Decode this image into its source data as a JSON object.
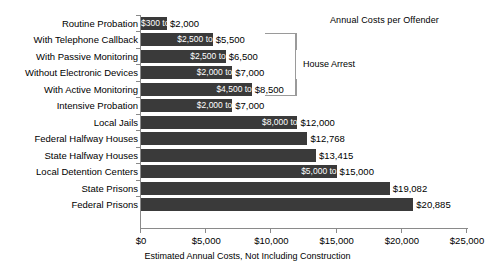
{
  "chart_data": {
    "type": "bar",
    "orientation": "horizontal",
    "title": "Annual Costs per Offender",
    "xlabel": "Estimated Annual Costs, Not Including Construction",
    "ylabel": "",
    "xlim": [
      0,
      25000
    ],
    "xticks": [
      0,
      5000,
      10000,
      15000,
      20000,
      25000
    ],
    "xtick_labels": [
      "$0",
      "$5,000",
      "$10,000",
      "$15,000",
      "$20,000",
      "$25,000"
    ],
    "grid": false,
    "legend": null,
    "categories": [
      "Routine Probation",
      "With Telephone Callback",
      "With Passive Monitoring",
      "Without Electronic Devices",
      "With Active Monitoring",
      "Intensive Probation",
      "Local Jails",
      "Federal Halfway Houses",
      "State Halfway Houses",
      "Local Detention Centers",
      "State Prisons",
      "Federal Prisons"
    ],
    "values": [
      2000,
      5500,
      6500,
      7000,
      8500,
      7000,
      12000,
      12768,
      13415,
      15000,
      19082,
      20885
    ],
    "range_low": [
      300,
      2500,
      2500,
      2000,
      4500,
      2000,
      8000,
      null,
      null,
      5000,
      null,
      null
    ],
    "bars": [
      {
        "category": "Routine Probation",
        "low": 300,
        "high": 2000,
        "inbar_label": "$300 to",
        "outbar_label": "$2,000"
      },
      {
        "category": "With Telephone Callback",
        "low": 2500,
        "high": 5500,
        "inbar_label": "$2,500 to",
        "outbar_label": "$5,500"
      },
      {
        "category": "With Passive Monitoring",
        "low": 2500,
        "high": 6500,
        "inbar_label": "$2,500 to",
        "outbar_label": "$6,500"
      },
      {
        "category": "Without Electronic Devices",
        "low": 2000,
        "high": 7000,
        "inbar_label": "$2,000 to",
        "outbar_label": "$7,000"
      },
      {
        "category": "With Active Monitoring",
        "low": 4500,
        "high": 8500,
        "inbar_label": "$4,500 to",
        "outbar_label": "$8,500"
      },
      {
        "category": "Intensive Probation",
        "low": 2000,
        "high": 7000,
        "inbar_label": "$2,000 to",
        "outbar_label": "$7,000"
      },
      {
        "category": "Local Jails",
        "low": 8000,
        "high": 12000,
        "inbar_label": "$8,000 to",
        "outbar_label": "$12,000"
      },
      {
        "category": "Federal Halfway Houses",
        "low": null,
        "high": 12768,
        "inbar_label": "",
        "outbar_label": "$12,768"
      },
      {
        "category": "State Halfway Houses",
        "low": null,
        "high": 13415,
        "inbar_label": "",
        "outbar_label": "$13,415"
      },
      {
        "category": "Local Detention Centers",
        "low": 5000,
        "high": 15000,
        "inbar_label": "$5,000 to",
        "outbar_label": "$15,000"
      },
      {
        "category": "State Prisons",
        "low": null,
        "high": 19082,
        "inbar_label": "",
        "outbar_label": "$19,082"
      },
      {
        "category": "Federal Prisons",
        "low": null,
        "high": 20885,
        "inbar_label": "",
        "outbar_label": "$20,885"
      }
    ],
    "annotations": [
      {
        "label": "House Arrest",
        "spans_categories": [
          "With Telephone Callback",
          "With Passive Monitoring",
          "Without Electronic Devices",
          "With Active Monitoring"
        ]
      }
    ],
    "colors": {
      "bar_fill": "#3a3a3a",
      "axis": "#8a8a8a",
      "bracket": "#9a9a9a",
      "inbar_text": "#ffffff",
      "text": "#000000",
      "background": "#ffffff"
    }
  }
}
